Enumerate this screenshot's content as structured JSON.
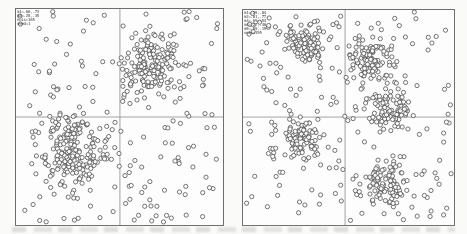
{
  "figure": {
    "background": "#fafaf9",
    "footer_ghost_band": true
  },
  "styles": {
    "plot_background": "#fdfdfd",
    "border_color": "#6e6e6e",
    "divider_color": "#8a8a8a",
    "legend_color": "#3c3c3c"
  },
  "chart_data": [
    {
      "type": "scatter",
      "title": "",
      "xlabel": "",
      "ylabel": "",
      "axis_range": {
        "x": [
          0,
          1
        ],
        "y": [
          0,
          1
        ]
      },
      "grid": "2x2 panel dividers, no ticks, no axis labels",
      "legend_position": "top-left-inside",
      "svg": "left-plot-svg",
      "legend_name": "left-plot-legend",
      "legend_lines": [
        "m1=.66,.73",
        "m2=.28,.35",
        "nois=165",
        "seed=1"
      ],
      "frame": {
        "x": 15,
        "y": 8,
        "w": 209,
        "h": 218
      },
      "panel_grid": {
        "rows": 2,
        "cols": 2,
        "divider_x_frac": 0.502,
        "divider_y_frac": 0.5
      },
      "marker": {
        "shape": "open-circle",
        "radius_px": 2.1,
        "stroke": "#4a4a4a",
        "stroke_width": 0.75,
        "fill": "#fcfcfc"
      },
      "clusters": [
        {
          "cx": 0.656,
          "cy": 0.271,
          "std": 0.075,
          "n": 175
        },
        {
          "cx": 0.278,
          "cy": 0.651,
          "std": 0.08,
          "n": 195
        }
      ],
      "noise": {
        "n": 165
      },
      "seed": 7
    },
    {
      "type": "scatter",
      "title": "",
      "xlabel": "",
      "ylabel": "",
      "axis_range": {
        "x": [
          0,
          1
        ],
        "y": [
          0,
          1
        ]
      },
      "grid": "2x2 panel dividers, no ticks, no axis labels",
      "legend_position": "top-left-inside",
      "svg": "right-plot-svg",
      "legend_name": "right-plot-legend",
      "legend_lines": [
        "m1=.29,.84",
        "m2=.61,.77",
        "m3=.69,.54",
        "m4=.27,.40",
        "m5=.69,.19",
        "nois=195"
      ],
      "frame": {
        "x": 242,
        "y": 9,
        "w": 213,
        "h": 217
      },
      "panel_grid": {
        "rows": 2,
        "cols": 2,
        "divider_x_frac": 0.484,
        "divider_y_frac": 0.498
      },
      "marker": {
        "shape": "open-circle",
        "radius_px": 2.1,
        "stroke": "#4a4a4a",
        "stroke_width": 0.75,
        "fill": "#fcfcfc"
      },
      "clusters": [
        {
          "cx": 0.286,
          "cy": 0.157,
          "std": 0.046,
          "n": 95
        },
        {
          "cx": 0.606,
          "cy": 0.226,
          "std": 0.052,
          "n": 105
        },
        {
          "cx": 0.685,
          "cy": 0.456,
          "std": 0.05,
          "n": 100
        },
        {
          "cx": 0.272,
          "cy": 0.599,
          "std": 0.05,
          "n": 95
        },
        {
          "cx": 0.685,
          "cy": 0.811,
          "std": 0.046,
          "n": 100
        }
      ],
      "noise": {
        "n": 195
      },
      "seed": 13
    }
  ]
}
